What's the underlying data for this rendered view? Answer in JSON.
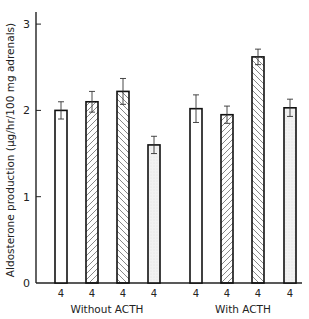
{
  "chart_data": {
    "type": "bar",
    "title": "",
    "xlabel": "",
    "ylabel": "Aldosterone production (µg/hr/100 mg adrenals)",
    "ylim": [
      0,
      3.2
    ],
    "yticks": [
      0,
      1,
      2,
      3
    ],
    "grid": false,
    "groups": [
      {
        "label": "Without ACTH",
        "bars": [
          {
            "pattern": "open",
            "value": 2.0,
            "error": 0.1,
            "n": "4"
          },
          {
            "pattern": "hatch-right",
            "value": 2.1,
            "error": 0.12,
            "n": "4"
          },
          {
            "pattern": "hatch-left",
            "value": 2.22,
            "error": 0.15,
            "n": "4"
          },
          {
            "pattern": "stippled",
            "value": 1.6,
            "error": 0.1,
            "n": "4"
          }
        ]
      },
      {
        "label": "With ACTH",
        "bars": [
          {
            "pattern": "open",
            "value": 2.02,
            "error": 0.16,
            "n": "4"
          },
          {
            "pattern": "hatch-right",
            "value": 1.95,
            "error": 0.1,
            "n": "4"
          },
          {
            "pattern": "hatch-left",
            "value": 2.62,
            "error": 0.09,
            "n": "4"
          },
          {
            "pattern": "stippled",
            "value": 2.03,
            "error": 0.1,
            "n": "4"
          }
        ]
      }
    ]
  },
  "labels": {
    "ylabel": "Aldosterone production (µg/hr/100 mg adrenals)",
    "group1": "Without ACTH",
    "group2": "With ACTH",
    "ytick0": "0",
    "ytick1": "1",
    "ytick2": "2",
    "ytick3": "3"
  }
}
